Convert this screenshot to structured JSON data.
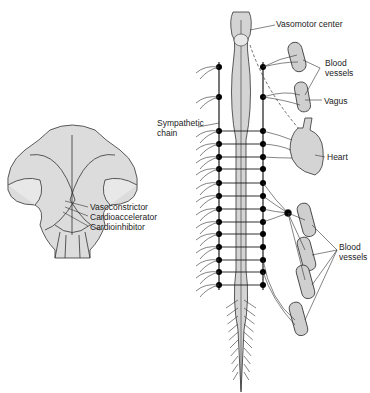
{
  "labels": {
    "vasomotor_center": "Vasomotor center",
    "blood_vessels_top_1": "Blood",
    "blood_vessels_top_2": "vessels",
    "vagus": "Vagus",
    "sympathetic_chain_1": "Sympathetic",
    "sympathetic_chain_2": "chain",
    "heart": "Heart",
    "vasoconstrictor": "Vasoconstrictor",
    "cardioaccelerator": "Cardioaccelerator",
    "cardioinhibitor": "Cardioinhibitor",
    "blood_vessels_bottom_1": "Blood",
    "blood_vessels_bottom_2": "vessels"
  },
  "colors": {
    "line": "#1a1a1a",
    "tissue_fill": "#d4d4d4",
    "node": "#000000"
  }
}
